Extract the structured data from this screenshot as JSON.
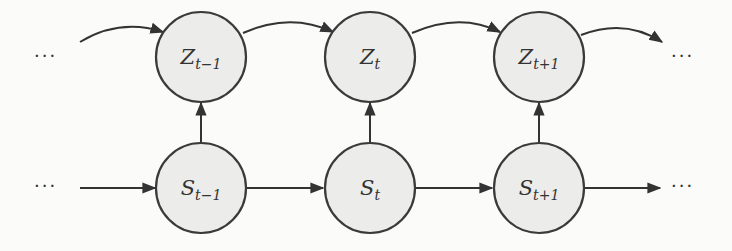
{
  "diagram": {
    "type": "dynamic-bayesian-network",
    "ellipsis": "···",
    "nodes": {
      "z_prev": {
        "main": "Z",
        "sub": "t−1"
      },
      "z_curr": {
        "main": "Z",
        "sub": "t"
      },
      "z_next": {
        "main": "Z",
        "sub": "t+1"
      },
      "s_prev": {
        "main": "S",
        "sub": "t−1"
      },
      "s_curr": {
        "main": "S",
        "sub": "t"
      },
      "s_next": {
        "main": "S",
        "sub": "t+1"
      }
    },
    "edges": [
      {
        "from": "…",
        "to": "Z_{t-1}",
        "style": "curved"
      },
      {
        "from": "Z_{t-1}",
        "to": "Z_t",
        "style": "curved"
      },
      {
        "from": "Z_t",
        "to": "Z_{t+1}",
        "style": "curved"
      },
      {
        "from": "Z_{t+1}",
        "to": "…",
        "style": "curved"
      },
      {
        "from": "…",
        "to": "S_{t-1}",
        "style": "straight"
      },
      {
        "from": "S_{t-1}",
        "to": "S_t",
        "style": "straight"
      },
      {
        "from": "S_t",
        "to": "S_{t+1}",
        "style": "straight"
      },
      {
        "from": "S_{t+1}",
        "to": "…",
        "style": "straight"
      },
      {
        "from": "S_{t-1}",
        "to": "Z_{t-1}",
        "style": "straight"
      },
      {
        "from": "S_t",
        "to": "Z_t",
        "style": "straight"
      },
      {
        "from": "S_{t+1}",
        "to": "Z_{t+1}",
        "style": "straight"
      }
    ],
    "colors": {
      "node_fill": "#ececea",
      "stroke": "#3a3a3a",
      "background": "#fbfbfa"
    }
  }
}
